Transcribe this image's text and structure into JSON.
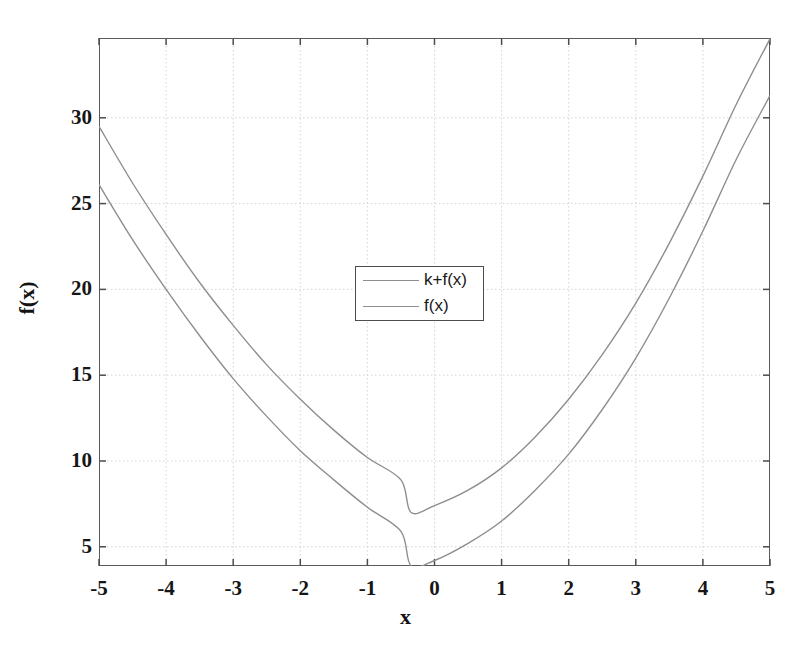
{
  "chart_data": {
    "type": "line",
    "title": "",
    "xlabel": "x",
    "ylabel": "f(x)",
    "xlim": [
      -5,
      5
    ],
    "ylim": [
      3.88,
      34.65
    ],
    "grid": true,
    "legend_position": "upper-center",
    "xticks": [
      -5,
      -4,
      -3,
      -2,
      -1,
      0,
      1,
      2,
      3,
      4,
      5
    ],
    "xtick_labels": [
      "-5",
      "-4",
      "-3",
      "-2",
      "-1",
      "0",
      "1",
      "2",
      "3",
      "4",
      "5"
    ],
    "yticks": [
      5,
      10,
      15,
      20,
      25,
      30
    ],
    "ytick_labels": [
      "5",
      "10",
      "15",
      "20",
      "25",
      "30"
    ],
    "series": [
      {
        "name": "k+f(x)",
        "color": "#8e8e8e",
        "linewidth": 1.4,
        "x": [
          -5,
          -4.5,
          -4,
          -3.5,
          -3,
          -2.5,
          -2,
          -1.5,
          -1,
          -0.5,
          -0.35,
          0,
          0.5,
          1,
          1.5,
          2,
          2.5,
          3,
          3.5,
          4,
          4.5,
          5
        ],
        "y": [
          29.5,
          26.2,
          23.2,
          20.4,
          17.9,
          15.6,
          13.6,
          11.8,
          10.2,
          8.9,
          7.0,
          7.4,
          8.3,
          9.6,
          11.4,
          13.6,
          16.2,
          19.2,
          22.7,
          26.6,
          30.8,
          34.6
        ]
      },
      {
        "name": "f(x)",
        "color": "#8e8e8e",
        "linewidth": 1.4,
        "x": [
          -5,
          -4.5,
          -4,
          -3.5,
          -3,
          -2.5,
          -2,
          -1.5,
          -1,
          -0.5,
          -0.35,
          0,
          0.5,
          1,
          1.5,
          2,
          2.5,
          3,
          3.5,
          4,
          4.5,
          5
        ],
        "y": [
          26.1,
          22.9,
          20.0,
          17.3,
          14.8,
          12.6,
          10.6,
          8.9,
          7.3,
          5.9,
          3.9,
          4.2,
          5.2,
          6.5,
          8.3,
          10.4,
          13.0,
          16.0,
          19.5,
          23.4,
          27.6,
          31.3
        ]
      }
    ]
  },
  "legend": {
    "entries": [
      {
        "label": "k+f(x)"
      },
      {
        "label": "f(x)"
      }
    ]
  },
  "axes": {
    "frame_color": "#5a5a5a",
    "grid_color": "#cfcfcf",
    "tick_color": "#4d4d4d"
  }
}
